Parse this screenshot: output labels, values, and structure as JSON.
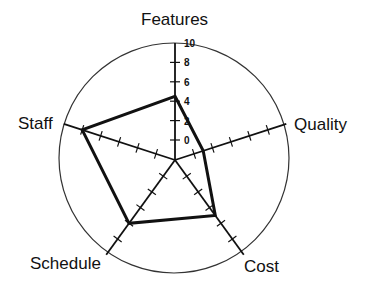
{
  "chart_data": {
    "type": "radar",
    "title": "",
    "axes": [
      "Features",
      "Quality",
      "Cost",
      "Schedule",
      "Staff"
    ],
    "series": [
      {
        "name": "Project profile",
        "values": [
          4.5,
          1,
          5,
          6,
          8
        ]
      }
    ],
    "scale": {
      "min": 0,
      "max": 10,
      "step": 2,
      "tick_labels": [
        "0",
        "2",
        "4",
        "6",
        "8",
        "10"
      ]
    },
    "grid": "outer circle with spoke tick marks",
    "legend": "none"
  },
  "labels": {
    "features": "Features",
    "quality": "Quality",
    "cost": "Cost",
    "schedule": "Schedule",
    "staff": "Staff"
  },
  "colors": {
    "line": "#111111",
    "background": "#ffffff"
  }
}
